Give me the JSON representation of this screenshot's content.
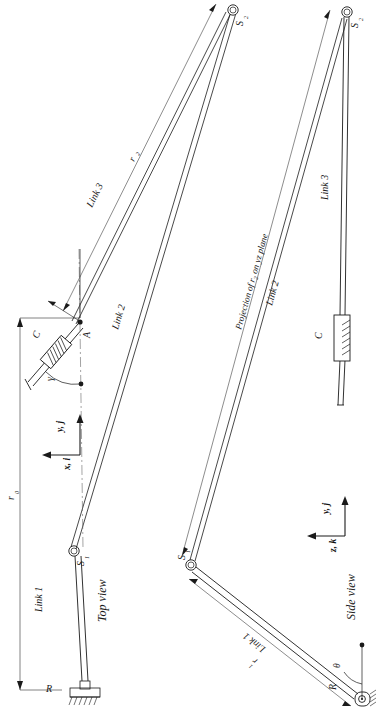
{
  "figure": {
    "type": "engineering-kinematic-diagram",
    "orientation": "rotated-90-ccw",
    "background_color": "#ffffff",
    "line_color": "#1a1a1a"
  },
  "views": {
    "top": {
      "caption": "Top view",
      "axes": [
        {
          "name": "y-axis-top",
          "label": "y, j"
        },
        {
          "name": "x-axis-top",
          "label": "x, i"
        }
      ],
      "links": [
        {
          "name": "link-1",
          "label": "Link 1"
        },
        {
          "name": "link-2",
          "label": "Link 2"
        },
        {
          "name": "link-3",
          "label": "Link 3"
        }
      ],
      "joints": [
        {
          "name": "joint-r",
          "label": "R",
          "kind": "revolute-grounded"
        },
        {
          "name": "joint-s1",
          "label": "S",
          "subscript": "1",
          "kind": "spherical"
        },
        {
          "name": "joint-s2",
          "label": "S",
          "subscript": "2",
          "kind": "spherical"
        }
      ],
      "points": [
        {
          "name": "point-a",
          "label": "A"
        }
      ],
      "elements": [
        {
          "name": "damper-c",
          "label": "C",
          "kind": "spring-damper"
        }
      ],
      "angles": [
        {
          "name": "angle-gamma",
          "label": "γ"
        }
      ],
      "dimensions": [
        {
          "name": "dim-r0",
          "label": "r",
          "subscript": "0"
        },
        {
          "name": "dim-r2",
          "label": "r",
          "subscript": "2"
        }
      ]
    },
    "side": {
      "caption": "Side view",
      "axes": [
        {
          "name": "y-axis-side",
          "label": "y, j"
        },
        {
          "name": "z-axis-side",
          "label": "z, k"
        }
      ],
      "links": [
        {
          "name": "link-1",
          "label": "Link 1"
        },
        {
          "name": "link-2",
          "label": "Link 2"
        },
        {
          "name": "link-3",
          "label": "Link 3"
        }
      ],
      "joints": [
        {
          "name": "joint-r",
          "label": "R",
          "kind": "revolute-pin"
        },
        {
          "name": "joint-s1",
          "label": "S",
          "subscript": "1",
          "kind": "spherical"
        },
        {
          "name": "joint-s2",
          "label": "S",
          "subscript": "2",
          "kind": "spherical"
        }
      ],
      "elements": [
        {
          "name": "damper-c",
          "label": "C",
          "kind": "spring-damper"
        }
      ],
      "angles": [
        {
          "name": "angle-theta",
          "label": "θ"
        }
      ],
      "dimensions": [
        {
          "name": "dim-r1",
          "label": "r",
          "subscript": "1"
        }
      ],
      "annotations": [
        {
          "name": "projection-note",
          "label": "Projection of r₂ on yz plane"
        }
      ]
    }
  },
  "text": {
    "top_view_caption": "Top view",
    "side_view_caption": "Side view",
    "link1": "Link 1",
    "link2": "Link 2",
    "link3": "Link 3",
    "label_A": "A",
    "label_C": "C",
    "label_R": "R",
    "label_S": "S",
    "sub_1": "1",
    "sub_2": "2",
    "sub_0": "0",
    "label_r": "r",
    "label_gamma": "γ",
    "label_theta": "θ",
    "axis_yj": "y, j",
    "axis_xi": "x, i",
    "axis_zk": "z, k",
    "projection_text": "Projection of r",
    "projection_text_tail": " on yz plane"
  }
}
